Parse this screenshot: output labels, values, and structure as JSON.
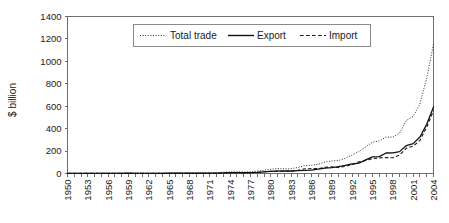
{
  "chart_data": {
    "type": "line",
    "title": "",
    "xlabel": "",
    "ylabel": "$ billion",
    "ylim": [
      0,
      1400
    ],
    "xlim": [
      1950,
      2004
    ],
    "grid": false,
    "legend_position": "top-center",
    "ytick_labels": [
      "0",
      "200",
      "400",
      "600",
      "800",
      "1000",
      "1200",
      "1400"
    ],
    "ytick_values": [
      0,
      200,
      400,
      600,
      800,
      1000,
      1200,
      1400
    ],
    "xtick_labels": [
      "1950",
      "1953",
      "1956",
      "1959",
      "1962",
      "1965",
      "1968",
      "1971",
      "1974",
      "1977",
      "1980",
      "1983",
      "1986",
      "1989",
      "1992",
      "1995",
      "1998",
      "2001",
      "2004"
    ],
    "xtick_values": [
      1950,
      1953,
      1956,
      1959,
      1962,
      1965,
      1968,
      1971,
      1974,
      1977,
      1980,
      1983,
      1986,
      1989,
      1992,
      1995,
      1998,
      2001,
      2004
    ],
    "x": [
      1950,
      1951,
      1952,
      1953,
      1954,
      1955,
      1956,
      1957,
      1958,
      1959,
      1960,
      1961,
      1962,
      1963,
      1964,
      1965,
      1966,
      1967,
      1968,
      1969,
      1970,
      1971,
      1972,
      1973,
      1974,
      1975,
      1976,
      1977,
      1978,
      1979,
      1980,
      1981,
      1982,
      1983,
      1984,
      1985,
      1986,
      1987,
      1988,
      1989,
      1990,
      1991,
      1992,
      1993,
      1994,
      1995,
      1996,
      1997,
      1998,
      1999,
      2000,
      2001,
      2002,
      2003,
      2004
    ],
    "series": [
      {
        "name": "Total trade",
        "style": "dotted",
        "values": [
          1.1,
          1.9,
          1.9,
          2.4,
          2.4,
          3.1,
          3.2,
          3.1,
          3.9,
          4.4,
          3.8,
          3.0,
          2.7,
          2.9,
          3.5,
          4.2,
          4.6,
          4.2,
          4.1,
          4.0,
          4.6,
          4.8,
          6.3,
          10.9,
          14.5,
          14.8,
          13.4,
          14.8,
          20.6,
          29.4,
          38.1,
          44.0,
          41.6,
          43.6,
          53.5,
          69.6,
          73.8,
          82.7,
          102.8,
          111.7,
          115.4,
          135.6,
          165.6,
          195.7,
          236.7,
          280.9,
          289.9,
          325.2,
          323.9,
          360.6,
          474.3,
          509.8,
          620.8,
          851.0,
          1154.6
        ]
      },
      {
        "name": "Export",
        "style": "solid",
        "values": [
          0.6,
          0.8,
          0.8,
          1.0,
          1.1,
          1.4,
          1.6,
          1.6,
          2.0,
          2.3,
          1.9,
          1.5,
          1.5,
          1.6,
          1.9,
          2.2,
          2.4,
          2.1,
          2.1,
          2.2,
          2.3,
          2.6,
          3.4,
          5.8,
          6.9,
          7.3,
          6.9,
          7.6,
          9.8,
          13.7,
          18.1,
          22.0,
          22.3,
          22.2,
          26.1,
          27.4,
          30.9,
          39.4,
          47.5,
          52.5,
          62.1,
          71.8,
          84.9,
          91.7,
          121.0,
          148.8,
          151.1,
          182.8,
          183.8,
          194.9,
          249.2,
          266.1,
          325.6,
          438.2,
          593.3
        ]
      },
      {
        "name": "Import",
        "style": "dashed",
        "values": [
          0.5,
          1.1,
          1.1,
          1.4,
          1.3,
          1.7,
          1.6,
          1.5,
          1.9,
          2.1,
          1.9,
          1.5,
          1.2,
          1.3,
          1.6,
          2.0,
          2.2,
          2.1,
          2.0,
          1.8,
          2.3,
          2.2,
          2.9,
          5.1,
          7.6,
          7.5,
          6.5,
          7.2,
          10.8,
          15.7,
          20.0,
          22.0,
          19.3,
          21.4,
          27.4,
          42.2,
          42.9,
          43.3,
          55.3,
          59.2,
          53.3,
          63.8,
          80.7,
          104.0,
          115.7,
          132.1,
          138.8,
          142.4,
          140.1,
          165.7,
          225.1,
          243.7,
          295.2,
          412.8,
          561.3
        ]
      }
    ]
  },
  "legend": {
    "items": [
      {
        "label": "Total trade",
        "style": "dotted"
      },
      {
        "label": "Export",
        "style": "solid"
      },
      {
        "label": "Import",
        "style": "dashed"
      }
    ]
  },
  "axes": {
    "y_title": "$ billion"
  }
}
